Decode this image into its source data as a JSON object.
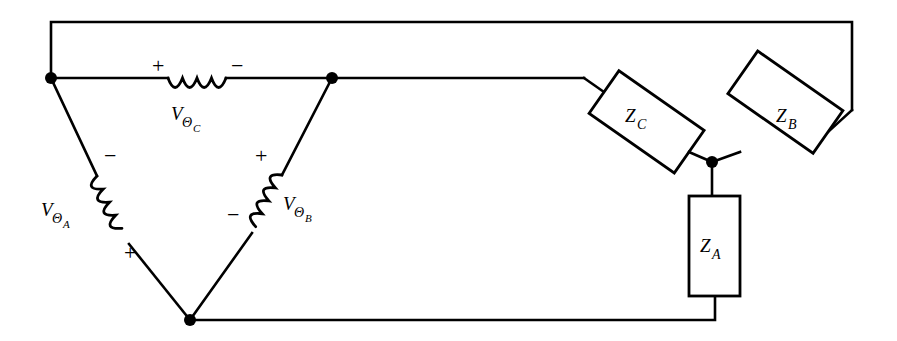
{
  "figure": {
    "background_color": "#ffffff",
    "line_color": "#000000",
    "width": 897,
    "height": 341
  },
  "sources": [
    {
      "id": "source-c",
      "element": "inductor-coil",
      "label_main": "V",
      "label_sub_theta": "Θ",
      "label_sub_phase": "C",
      "polarity_first": "+",
      "polarity_second": "−",
      "orientation": "horizontal",
      "position": "top-edge"
    },
    {
      "id": "source-a",
      "element": "inductor-coil",
      "label_main": "V",
      "label_sub_theta": "Θ",
      "label_sub_phase": "A",
      "polarity_first": "−",
      "polarity_second": "+",
      "orientation": "diagonal-down-right",
      "position": "left-edge"
    },
    {
      "id": "source-b",
      "element": "inductor-coil",
      "label_main": "V",
      "label_sub_theta": "Θ",
      "label_sub_phase": "B",
      "polarity_first": "+",
      "polarity_second": "−",
      "orientation": "diagonal-down-left",
      "position": "right-edge-of-triangle"
    }
  ],
  "loads": [
    {
      "id": "impedance-c",
      "element": "rectangle-box",
      "label_main": "Z",
      "label_sub": "C",
      "orientation": "tilted-down-right",
      "rotation_deg": 35
    },
    {
      "id": "impedance-b",
      "element": "rectangle-box",
      "label_main": "Z",
      "label_sub": "B",
      "orientation": "tilted-up-right",
      "rotation_deg": -35
    },
    {
      "id": "impedance-a",
      "element": "rectangle-box",
      "label_main": "Z",
      "label_sub": "A",
      "orientation": "vertical",
      "rotation_deg": 0
    }
  ],
  "nodes": [
    {
      "id": "node-top-left",
      "x": 51,
      "y": 78
    },
    {
      "id": "node-top-middle",
      "x": 332,
      "y": 78
    },
    {
      "id": "node-bottom",
      "x": 190,
      "y": 320
    },
    {
      "id": "node-star-center",
      "x": 712,
      "y": 162
    }
  ],
  "signs": {
    "plus": "+",
    "minus": "−"
  }
}
